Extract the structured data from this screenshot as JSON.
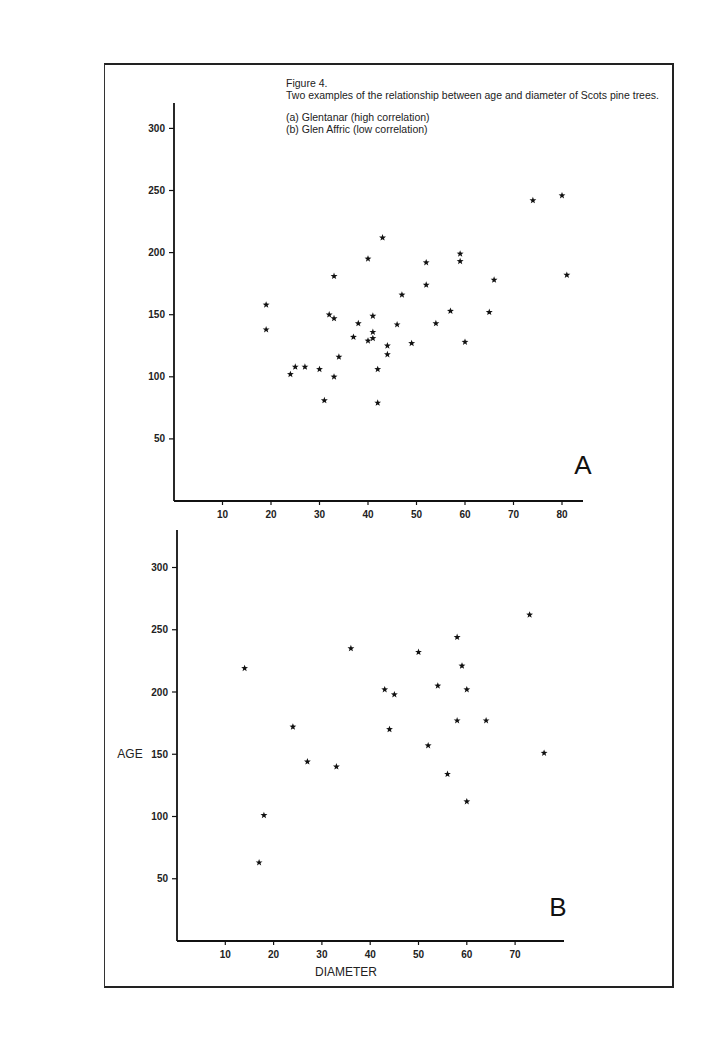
{
  "figure": {
    "label": "Figure 4.",
    "title": "Two examples of the relationship between age and diameter of Scots pine trees.",
    "legend": [
      "(a)  Glentanar (high correlation)",
      "(b)  Glen Affric (low correlation)"
    ]
  },
  "axes": {
    "ylabel": "AGE",
    "xlabel": "DIAMETER",
    "y_ticks": [
      50,
      100,
      150,
      200,
      250,
      300
    ],
    "x_ticks_a": [
      10,
      20,
      30,
      40,
      50,
      60,
      70,
      80
    ],
    "x_ticks_b": [
      10,
      20,
      30,
      40,
      50,
      60,
      70
    ]
  },
  "panels": {
    "a_label": "A",
    "b_label": "B"
  },
  "chart_data": [
    {
      "type": "scatter",
      "title": "(a) Glentanar (high correlation)",
      "panel": "A",
      "xlabel": "DIAMETER",
      "ylabel": "AGE",
      "xlim": [
        0,
        84
      ],
      "ylim": [
        0,
        320
      ],
      "marker": "star",
      "x": [
        19,
        19,
        24,
        25,
        27,
        30,
        31,
        32,
        33,
        33,
        33,
        34,
        37,
        38,
        40,
        40,
        41,
        41,
        41,
        42,
        42,
        43,
        44,
        44,
        46,
        47,
        49,
        52,
        52,
        54,
        57,
        59,
        59,
        60,
        65,
        66,
        74,
        80,
        81
      ],
      "y": [
        158,
        138,
        102,
        108,
        108,
        106,
        81,
        150,
        147,
        100,
        181,
        116,
        132,
        143,
        129,
        195,
        149,
        136,
        131,
        106,
        79,
        212,
        125,
        118,
        142,
        166,
        127,
        192,
        174,
        143,
        153,
        193,
        199,
        128,
        152,
        178,
        242,
        246,
        182
      ]
    },
    {
      "type": "scatter",
      "title": "(b) Glen Affric (low correlation)",
      "panel": "B",
      "xlabel": "DIAMETER",
      "ylabel": "AGE",
      "xlim": [
        0,
        80
      ],
      "ylim": [
        0,
        330
      ],
      "marker": "star",
      "x": [
        14,
        17,
        18,
        24,
        27,
        33,
        36,
        43,
        44,
        45,
        50,
        52,
        54,
        56,
        58,
        58,
        59,
        60,
        60,
        64,
        73,
        76
      ],
      "y": [
        219,
        63,
        101,
        172,
        144,
        140,
        235,
        202,
        170,
        198,
        232,
        157,
        205,
        134,
        244,
        177,
        221,
        202,
        112,
        177,
        262,
        151
      ]
    }
  ]
}
